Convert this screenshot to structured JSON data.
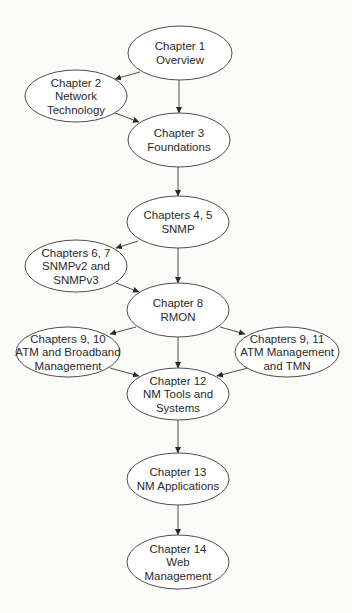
{
  "diagram": {
    "type": "flowchart",
    "background": "#fbfbf8",
    "stroke_color": "#3a3a3a",
    "nodes": [
      {
        "id": "ch1",
        "cx": 180,
        "cy": 53,
        "rx": 52,
        "ry": 27,
        "lines": [
          "Chapter 1",
          "Overview"
        ]
      },
      {
        "id": "ch2",
        "cx": 76,
        "cy": 96,
        "rx": 51,
        "ry": 26,
        "lines": [
          "Chapter 2",
          "Network",
          "Technology"
        ]
      },
      {
        "id": "ch3",
        "cx": 179,
        "cy": 140,
        "rx": 51,
        "ry": 27,
        "lines": [
          "Chapter 3",
          "Foundations"
        ]
      },
      {
        "id": "ch4_5",
        "cx": 178,
        "cy": 222,
        "rx": 51,
        "ry": 26,
        "lines": [
          "Chapters 4, 5",
          "SNMP"
        ]
      },
      {
        "id": "ch6_7",
        "cx": 76,
        "cy": 266,
        "rx": 51,
        "ry": 26,
        "lines": [
          "Chapters 6, 7",
          "SNMPv2 and",
          "SNMPv3"
        ]
      },
      {
        "id": "ch8",
        "cx": 178,
        "cy": 310,
        "rx": 51,
        "ry": 27,
        "lines": [
          "Chapter 8",
          "RMON"
        ]
      },
      {
        "id": "ch9_10",
        "cx": 68,
        "cy": 352,
        "rx": 52,
        "ry": 25,
        "lines": [
          "Chapters 9, 10",
          "ATM and Broadband",
          "Management"
        ]
      },
      {
        "id": "ch9_11",
        "cx": 287,
        "cy": 352,
        "rx": 52,
        "ry": 25,
        "lines": [
          "Chapters 9, 11",
          "ATM Management",
          "and TMN"
        ]
      },
      {
        "id": "ch12",
        "cx": 178,
        "cy": 394,
        "rx": 51,
        "ry": 26,
        "lines": [
          "Chapter 12",
          "NM Tools and",
          "Systems"
        ]
      },
      {
        "id": "ch13",
        "cx": 178,
        "cy": 479,
        "rx": 51,
        "ry": 26,
        "lines": [
          "Chapter 13",
          "NM Applications"
        ]
      },
      {
        "id": "ch14",
        "cx": 178,
        "cy": 562,
        "rx": 51,
        "ry": 27,
        "lines": [
          "Chapter 14",
          "Web",
          "Management"
        ]
      }
    ],
    "edges": [
      {
        "from": "ch1",
        "to": "ch2",
        "x1": 140,
        "y1": 72,
        "x2": 115,
        "y2": 79
      },
      {
        "from": "ch1",
        "to": "ch3",
        "x1": 179,
        "y1": 80,
        "x2": 179,
        "y2": 113
      },
      {
        "from": "ch2",
        "to": "ch3",
        "x1": 115,
        "y1": 113,
        "x2": 139,
        "y2": 122
      },
      {
        "from": "ch3",
        "to": "ch4_5",
        "x1": 178,
        "y1": 167,
        "x2": 178,
        "y2": 196
      },
      {
        "from": "ch4_5",
        "to": "ch6_7",
        "x1": 138,
        "y1": 241,
        "x2": 116,
        "y2": 248
      },
      {
        "from": "ch4_5",
        "to": "ch8",
        "x1": 178,
        "y1": 248,
        "x2": 178,
        "y2": 283
      },
      {
        "from": "ch6_7",
        "to": "ch8",
        "x1": 116,
        "y1": 283,
        "x2": 139,
        "y2": 292
      },
      {
        "from": "ch8",
        "to": "ch9_10",
        "x1": 136,
        "y1": 327,
        "x2": 110,
        "y2": 334
      },
      {
        "from": "ch8",
        "to": "ch9_11",
        "x1": 220,
        "y1": 327,
        "x2": 245,
        "y2": 334
      },
      {
        "from": "ch8",
        "to": "ch12",
        "x1": 178,
        "y1": 337,
        "x2": 178,
        "y2": 368
      },
      {
        "from": "ch9_10",
        "to": "ch12",
        "x1": 110,
        "y1": 368,
        "x2": 139,
        "y2": 376
      },
      {
        "from": "ch9_11",
        "to": "ch12",
        "x1": 248,
        "y1": 368,
        "x2": 217,
        "y2": 376
      },
      {
        "from": "ch12",
        "to": "ch13",
        "x1": 178,
        "y1": 420,
        "x2": 178,
        "y2": 453
      },
      {
        "from": "ch13",
        "to": "ch14",
        "x1": 178,
        "y1": 505,
        "x2": 178,
        "y2": 535
      }
    ]
  }
}
